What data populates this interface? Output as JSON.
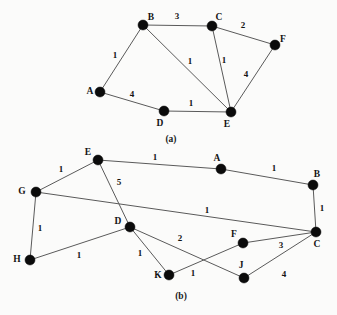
{
  "figure": {
    "background_color": "#fbfbfa",
    "node_color": "#0b0b0b",
    "edge_color": "#5a5a5a",
    "text_color": "#141414",
    "panels": [
      {
        "id": "panel-a",
        "caption": "(a)",
        "caption_pos": {
          "x": 171,
          "y": 142
        },
        "nodes": [
          {
            "id": "A",
            "label": "A",
            "x": 100,
            "y": 92,
            "lx": 90,
            "ly": 94
          },
          {
            "id": "B",
            "label": "B",
            "x": 143,
            "y": 25,
            "lx": 151,
            "ly": 20
          },
          {
            "id": "C",
            "label": "C",
            "x": 212,
            "y": 26,
            "lx": 219,
            "ly": 20
          },
          {
            "id": "D",
            "label": "D",
            "x": 164,
            "y": 111,
            "lx": 160,
            "ly": 126
          },
          {
            "id": "E",
            "label": "E",
            "x": 231,
            "y": 112,
            "lx": 227,
            "ly": 127
          },
          {
            "id": "F",
            "label": "F",
            "x": 275,
            "y": 45,
            "lx": 283,
            "ly": 42
          }
        ],
        "edges": [
          {
            "from": "A",
            "to": "B",
            "weight": "1",
            "lx": 115,
            "ly": 58
          },
          {
            "from": "B",
            "to": "C",
            "weight": "3",
            "lx": 177,
            "ly": 19
          },
          {
            "from": "B",
            "to": "E",
            "weight": "1",
            "lx": 190,
            "ly": 64
          },
          {
            "from": "C",
            "to": "E",
            "weight": "1",
            "lx": 224,
            "ly": 63
          },
          {
            "from": "C",
            "to": "F",
            "weight": "2",
            "lx": 243,
            "ly": 28
          },
          {
            "from": "E",
            "to": "F",
            "weight": "4",
            "lx": 246,
            "ly": 77
          },
          {
            "from": "A",
            "to": "D",
            "weight": "4",
            "lx": 132,
            "ly": 97
          },
          {
            "from": "D",
            "to": "E",
            "weight": "1",
            "lx": 191,
            "ly": 106
          }
        ]
      },
      {
        "id": "panel-b",
        "caption": "(b)",
        "caption_pos": {
          "x": 181,
          "y": 299
        },
        "nodes": [
          {
            "id": "E",
            "label": "E",
            "x": 98,
            "y": 160,
            "lx": 88,
            "ly": 155
          },
          {
            "id": "A",
            "label": "A",
            "x": 221,
            "y": 169,
            "lx": 217,
            "ly": 161
          },
          {
            "id": "B",
            "label": "B",
            "x": 313,
            "y": 185,
            "lx": 317,
            "ly": 177
          },
          {
            "id": "G",
            "label": "G",
            "x": 36,
            "y": 192,
            "lx": 22,
            "ly": 194
          },
          {
            "id": "D",
            "label": "D",
            "x": 130,
            "y": 227,
            "lx": 118,
            "ly": 224
          },
          {
            "id": "C",
            "label": "C",
            "x": 316,
            "y": 232,
            "lx": 317,
            "ly": 247
          },
          {
            "id": "F",
            "label": "F",
            "x": 243,
            "y": 243,
            "lx": 234,
            "ly": 237
          },
          {
            "id": "H",
            "label": "H",
            "x": 30,
            "y": 260,
            "lx": 17,
            "ly": 262
          },
          {
            "id": "K",
            "label": "K",
            "x": 169,
            "y": 275,
            "lx": 158,
            "ly": 278
          },
          {
            "id": "J",
            "label": "J",
            "x": 244,
            "y": 278,
            "lx": 241,
            "ly": 268
          }
        ],
        "edges": [
          {
            "from": "E",
            "to": "A",
            "weight": "1",
            "lx": 155,
            "ly": 160
          },
          {
            "from": "A",
            "to": "B",
            "weight": "1",
            "lx": 274,
            "ly": 171
          },
          {
            "from": "E",
            "to": "G",
            "weight": "1",
            "lx": 61,
            "ly": 172
          },
          {
            "from": "E",
            "to": "D",
            "weight": "5",
            "lx": 119,
            "ly": 185
          },
          {
            "from": "G",
            "to": "C",
            "weight": "1",
            "lx": 207,
            "ly": 213
          },
          {
            "from": "B",
            "to": "C",
            "weight": "1",
            "lx": 322,
            "ly": 211
          },
          {
            "from": "G",
            "to": "H",
            "weight": "1",
            "lx": 40,
            "ly": 231
          },
          {
            "from": "H",
            "to": "D",
            "weight": "1",
            "lx": 79,
            "ly": 258
          },
          {
            "from": "D",
            "to": "K",
            "weight": "1",
            "lx": 140,
            "ly": 256
          },
          {
            "from": "D",
            "to": "J",
            "weight": "2",
            "lx": 180,
            "ly": 241
          },
          {
            "from": "K",
            "to": "F",
            "weight": "1",
            "lx": 193,
            "ly": 276
          },
          {
            "from": "F",
            "to": "C",
            "weight": "3",
            "lx": 281,
            "ly": 248
          },
          {
            "from": "J",
            "to": "C",
            "weight": "4",
            "lx": 284,
            "ly": 277
          }
        ]
      }
    ]
  }
}
